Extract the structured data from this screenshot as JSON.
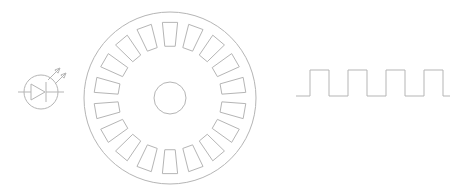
{
  "diagram": {
    "title": "Optical rotary encoder principle",
    "background_color": "#ffffff",
    "stroke_color": "#b5b5b5",
    "stroke_width": 1,
    "canvas": {
      "width": 464,
      "height": 196
    }
  },
  "emitter": {
    "label": "led-photo-emitter-symbol",
    "description": "Circled diode with two emission arrows",
    "center": {
      "x": 41,
      "y": 92
    },
    "circle_radius": 17,
    "lead_left_x": 18,
    "lead_right_x": 64,
    "diode_triangle": {
      "x1": 31,
      "y1": 84,
      "x2": 31,
      "y2": 100,
      "x3": 45,
      "y3": 92
    },
    "cathode_bar": {
      "x": 46,
      "y1": 82,
      "y2": 102
    },
    "arrows": [
      {
        "name": "emission-arrow-1",
        "x1": 48,
        "y1": 80,
        "x2": 60,
        "y2": 68
      },
      {
        "name": "emission-arrow-2",
        "x1": 55,
        "y1": 84,
        "x2": 66,
        "y2": 73
      }
    ]
  },
  "encoder_wheel": {
    "label": "slotted-encoder-disc",
    "center": {
      "x": 170,
      "y": 98
    },
    "outer_radius": 86,
    "hub_radius": 16,
    "slot_count": 18,
    "slot_inner_radius": 52,
    "slot_outer_radius": 76,
    "slot_angular_width_deg": 11.5,
    "start_angle_deg": -90
  },
  "waveform": {
    "label": "encoder-output-square-wave",
    "type": "square",
    "baseline_y": 96,
    "high_y": 70,
    "start_x": 296,
    "end_x": 450,
    "pulse_count": 4,
    "period_px": 38,
    "high_width_px": 19,
    "duty_cycle": 0.5,
    "lead_in_px": 14
  },
  "chart_data": {
    "type": "line",
    "xlabel": "",
    "ylabel": "",
    "x": [
      296,
      310,
      310,
      329,
      329,
      348,
      348,
      367,
      367,
      386,
      386,
      405,
      405,
      424,
      424,
      443,
      443,
      450
    ],
    "y": [
      96,
      96,
      70,
      70,
      96,
      96,
      70,
      70,
      96,
      96,
      70,
      70,
      96,
      96,
      70,
      70,
      96,
      96
    ],
    "series": [
      {
        "name": "output-signal",
        "values": [
          0,
          0,
          1,
          1,
          0,
          0,
          1,
          1,
          0,
          0,
          1,
          1,
          0,
          0,
          1,
          1,
          0,
          0
        ]
      }
    ],
    "ylim": [
      0,
      1
    ],
    "grid": false,
    "legend": "none"
  }
}
